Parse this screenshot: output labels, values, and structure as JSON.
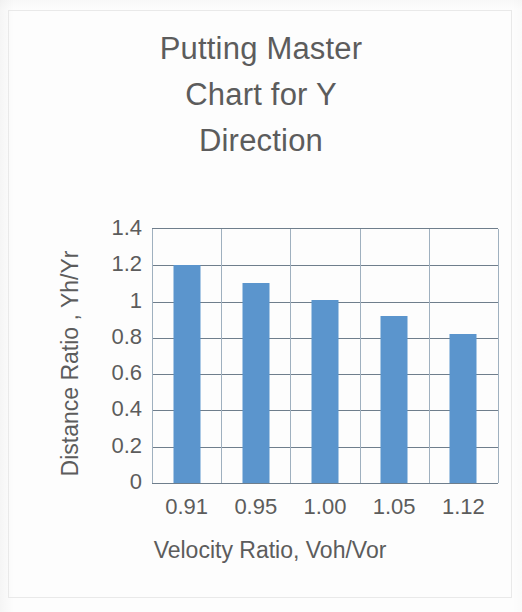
{
  "chart_data": {
    "type": "bar",
    "title": "Putting Master\nChart for Y\nDirection",
    "title_lines": [
      "Putting Master",
      "Chart for Y",
      "Direction"
    ],
    "xlabel": "Velocity  Ratio, Voh/Vor",
    "ylabel": "Distance Ratio , Yh/Yr",
    "categories": [
      "0.91",
      "0.95",
      "1.00",
      "1.05",
      "1.12"
    ],
    "values": [
      1.2,
      1.1,
      1.01,
      0.92,
      0.82
    ],
    "ylim": [
      0,
      1.4
    ],
    "ytick_values": [
      1.4,
      1.2,
      1.0,
      0.8,
      0.6,
      0.4,
      0.2,
      0
    ],
    "ytick_labels": [
      "1.4",
      "1.2",
      "1",
      "0.8",
      "0.6",
      "0.4",
      "0.2",
      "0"
    ],
    "grid": "horizontal-and-vertical",
    "legend": "none",
    "bar_color": "#5b95cd",
    "gridline_color": "#6f7e8c",
    "text_color": "#5c5c5c"
  }
}
